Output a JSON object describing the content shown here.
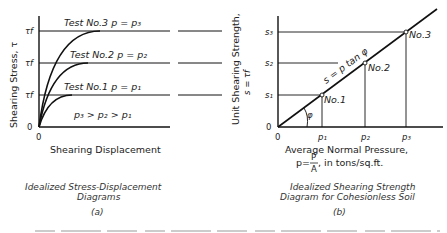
{
  "panel_a": {
    "y_axis_label": "Shearing Stress, τ",
    "x_axis_label": "Shearing Displacement",
    "origin_x": "0",
    "origin_y": "0",
    "curves": [
      {
        "label": "Test No.3  p = p₃",
        "tick": "τf"
      },
      {
        "label": "Test No.2  p = p₂",
        "tick": "τf"
      },
      {
        "label": "Test No.1  p = p₁",
        "tick": "τf"
      }
    ],
    "relation": "p₃ > p₂ > p₁",
    "caption_line1": "Idealized Stress-Displacement",
    "caption_line2": "Diagrams",
    "tag": "(a)"
  },
  "panel_b": {
    "y_axis_label_line1": "Unit Shearing Strength,",
    "y_axis_label_line2": "s = τf",
    "x_axis_label_line1": "Average Normal Pressure,",
    "x_axis_label_line2": "p = P/A , in tons/sq.ft.",
    "p_formula_p": "p=",
    "p_formula_num": "P",
    "p_formula_den": "A",
    "p_formula_rest": ", in tons/sq.ft.",
    "origin_x": "0",
    "origin_y": "0",
    "y_ticks": [
      "s₁",
      "s₂",
      "s₃"
    ],
    "x_ticks": [
      "p₁",
      "p₂",
      "p₃"
    ],
    "points": [
      "No.1",
      "No.2",
      "No.3"
    ],
    "line_label": "s = p tan φ",
    "angle_label": "φ",
    "caption_line1": "Idealized Shearing Strength",
    "caption_line2": "Diagram for Cohesionless Soil",
    "tag": "(b)"
  }
}
